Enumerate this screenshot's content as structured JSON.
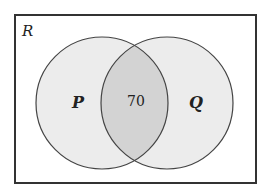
{
  "diagram": {
    "type": "venn",
    "universe_label": "R",
    "sets": [
      {
        "label": "P",
        "cx": 102,
        "cy": 103,
        "r": 66
      },
      {
        "label": "Q",
        "cx": 167,
        "cy": 103,
        "r": 66
      }
    ],
    "intersection_value": "70",
    "colors": {
      "border": "#333333",
      "circle_fill": "#ececec",
      "intersection_fill": "#d3d3d3",
      "background": "#ffffff"
    }
  }
}
